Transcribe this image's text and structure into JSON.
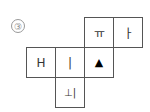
{
  "problem_number": "③",
  "net": {
    "faces": [
      {
        "id": "top-1",
        "symbol": "ㅠ",
        "rotation": 0
      },
      {
        "id": "top-2",
        "symbol": "ㅏ",
        "rotation": 0
      },
      {
        "id": "mid-1",
        "symbol": "H",
        "rotation": 0
      },
      {
        "id": "mid-2",
        "symbol": "|",
        "rotation": 0
      },
      {
        "id": "mid-3",
        "symbol": "▲",
        "rotation": 0
      },
      {
        "id": "bottom-1",
        "symbol": "⊥|",
        "rotation": 0
      }
    ]
  }
}
